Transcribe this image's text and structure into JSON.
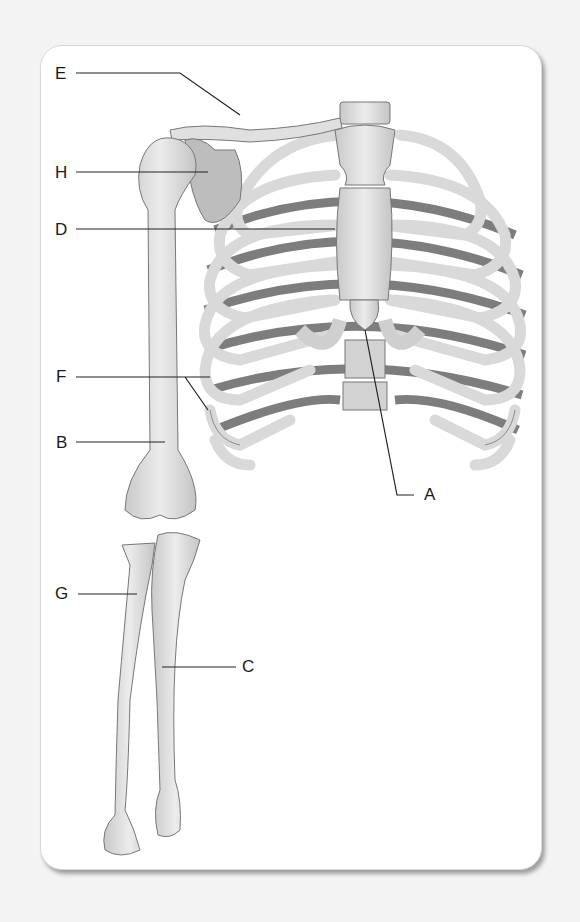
{
  "figure": {
    "labels": [
      {
        "id": "E",
        "text": "E",
        "x": 55,
        "y": 65
      },
      {
        "id": "H",
        "text": "H",
        "x": 55,
        "y": 164
      },
      {
        "id": "D",
        "text": "D",
        "x": 55,
        "y": 221
      },
      {
        "id": "F",
        "text": "F",
        "x": 55,
        "y": 368
      },
      {
        "id": "B",
        "text": "B",
        "x": 55,
        "y": 434
      },
      {
        "id": "A",
        "text": "A",
        "x": 424,
        "y": 486
      },
      {
        "id": "G",
        "text": "G",
        "x": 55,
        "y": 585
      },
      {
        "id": "C",
        "text": "C",
        "x": 242,
        "y": 658
      }
    ],
    "colors": {
      "bone": "#e2e2e2",
      "bone_shade": "#b5b5b5",
      "cartilage": "#cfcfcf",
      "rib_back": "#7d7d7d",
      "line": "#222222",
      "card": "#ffffff",
      "background": "#f3f3f3"
    }
  }
}
